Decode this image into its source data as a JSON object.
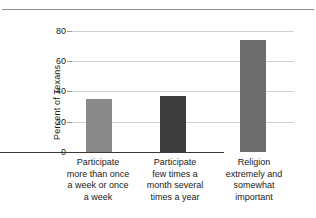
{
  "chart_data": {
    "type": "bar",
    "title": "",
    "xlabel": "",
    "ylabel": "Percent of Texans",
    "ylim": [
      0,
      80
    ],
    "yticks": [
      0,
      20,
      40,
      60,
      80
    ],
    "grid": true,
    "legend": "none",
    "categories": [
      "Participate more than once a week or once a week",
      "Participate few times a month several times a year",
      "Religion extremely and somewhat important"
    ],
    "category_lines": [
      [
        "Participate",
        "more than once",
        "a week or once",
        "a week"
      ],
      [
        "Participate",
        "few times a",
        "month several",
        "times a year"
      ],
      [
        "Religion",
        "extremely and",
        "somewhat",
        "important"
      ]
    ],
    "values": [
      35,
      37,
      74
    ],
    "bar_colors": [
      "#8a8a8a",
      "#3d3d3d",
      "#6e6e6e"
    ]
  },
  "axis": {
    "ytick_0": "0",
    "ytick_20": "20",
    "ytick_40": "40",
    "ytick_60": "60",
    "ytick_80": "80",
    "ylabel": "Percent of Texans"
  },
  "categories": {
    "c0": {
      "l0": "Participate",
      "l1": "more than once",
      "l2": "a week or once",
      "l3": "a week"
    },
    "c1": {
      "l0": "Participate",
      "l1": "few times a",
      "l2": "month several",
      "l3": "times a year"
    },
    "c2": {
      "l0": "Religion",
      "l1": "extremely and",
      "l2": "somewhat",
      "l3": "important"
    }
  },
  "colors": {
    "rule": "#8e8e8e",
    "grid": "#d2d2d2",
    "axis": "#3a3a3a",
    "bar1": "#8a8a8a",
    "bar2": "#3d3d3d",
    "bar3": "#6e6e6e"
  }
}
